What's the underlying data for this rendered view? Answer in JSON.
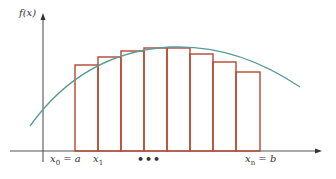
{
  "diagram": {
    "y_axis_label": "f(x)",
    "x_labels": [
      {
        "var": "x",
        "sub": "0",
        "rest": " = a"
      },
      {
        "var": "x",
        "sub": "1",
        "rest": ""
      },
      {
        "var": "x",
        "sub": "n",
        "rest": " = b"
      }
    ],
    "ellipsis": "•••",
    "colors": {
      "axis": "#555555",
      "curve": "#5a9a9a",
      "rectangles": "#b5482f"
    },
    "rectangles": [
      {
        "x0": 75,
        "x1": 98,
        "top": 65
      },
      {
        "x0": 98,
        "x1": 121,
        "top": 57
      },
      {
        "x0": 121,
        "x1": 144,
        "top": 51
      },
      {
        "x0": 144,
        "x1": 167,
        "top": 48
      },
      {
        "x0": 167,
        "x1": 190,
        "top": 48
      },
      {
        "x0": 190,
        "x1": 213,
        "top": 54
      },
      {
        "x0": 213,
        "x1": 236,
        "top": 62
      },
      {
        "x0": 236,
        "x1": 260,
        "top": 72
      }
    ],
    "baseline_y": 151
  }
}
